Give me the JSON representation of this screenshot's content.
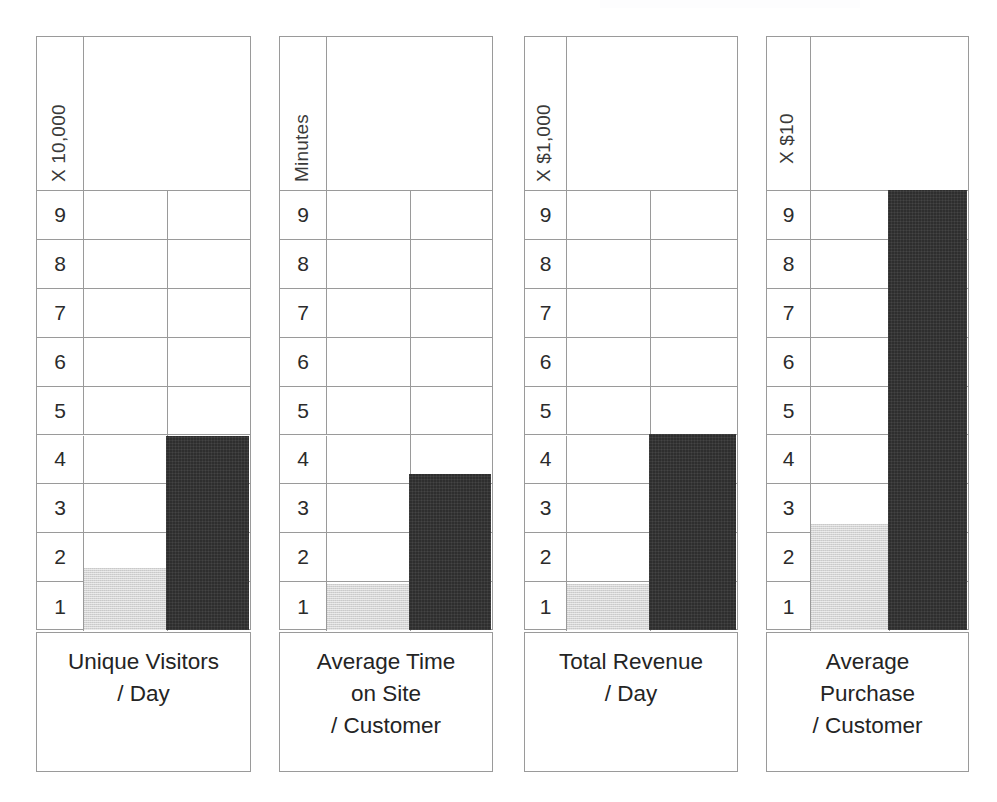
{
  "figure": {
    "background_color": "#ffffff",
    "grid_line_color": "#9a9a9a",
    "light_bar_color": "#d4d4d4",
    "dark_bar_color": "#2e2e2e",
    "axis_max": 10,
    "tick_labels": [
      "9",
      "8",
      "7",
      "6",
      "5",
      "4",
      "3",
      "2",
      "1"
    ]
  },
  "chart_data": {
    "type": "bar",
    "title": "",
    "xlabel": "",
    "ylabel": "",
    "grid": true,
    "legend": "none",
    "ylim": [
      0,
      10
    ],
    "ticks": [
      1,
      2,
      3,
      4,
      5,
      6,
      7,
      8,
      9
    ],
    "panels": [
      {
        "caption_lines": [
          "Unique Visitors",
          "/ Day"
        ],
        "unit_label": "X 10,000",
        "tick_labels": [
          "9",
          "8",
          "7",
          "6",
          "5",
          "4",
          "3",
          "2",
          "1"
        ],
        "bars": [
          {
            "series": "before",
            "value": 1.4,
            "color": "#d4d4d4"
          },
          {
            "series": "after",
            "value": 4.4,
            "color": "#2e2e2e"
          }
        ]
      },
      {
        "caption_lines": [
          "Average Time",
          "on Site",
          "/ Customer"
        ],
        "unit_label": "Minutes",
        "tick_labels": [
          "9",
          "8",
          "7",
          "6",
          "5",
          "4",
          "3",
          "2",
          "1"
        ],
        "bars": [
          {
            "series": "before",
            "value": 1.05,
            "color": "#d4d4d4"
          },
          {
            "series": "after",
            "value": 3.55,
            "color": "#2e2e2e"
          }
        ]
      },
      {
        "caption_lines": [
          "Total Revenue",
          "/ Day"
        ],
        "unit_label": "X $1,000",
        "tick_labels": [
          "9",
          "8",
          "7",
          "6",
          "5",
          "4",
          "3",
          "2",
          "1"
        ],
        "bars": [
          {
            "series": "before",
            "value": 1.05,
            "color": "#d4d4d4"
          },
          {
            "series": "after",
            "value": 4.45,
            "color": "#2e2e2e"
          }
        ]
      },
      {
        "caption_lines": [
          "Average",
          "Purchase",
          "/ Customer"
        ],
        "unit_label": "X $10",
        "tick_labels": [
          "9",
          "8",
          "7",
          "6",
          "5",
          "4",
          "3",
          "2",
          "1"
        ],
        "bars": [
          {
            "series": "before",
            "value": 2.4,
            "color": "#d4d4d4"
          },
          {
            "series": "after",
            "value": 10.0,
            "color": "#2e2e2e"
          }
        ]
      }
    ]
  }
}
